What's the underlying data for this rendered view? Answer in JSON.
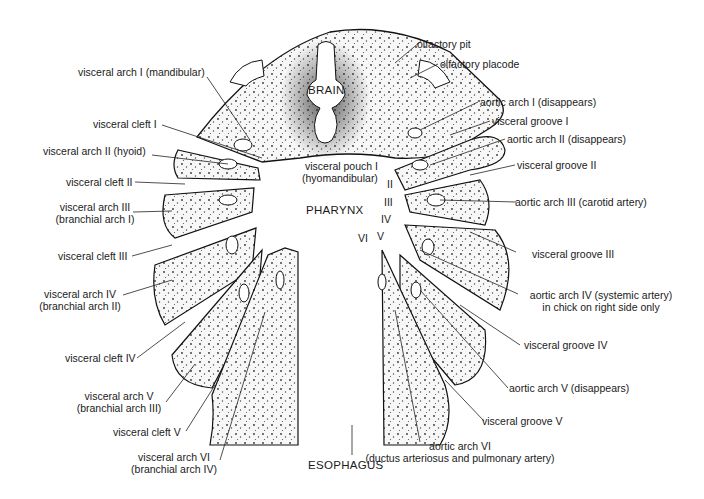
{
  "diagram": {
    "center_labels": {
      "brain": "BRAIN",
      "pharynx": "PHARYNX",
      "esophagus": "ESOPHAGUS"
    },
    "left_labels": [
      {
        "id": "va1",
        "text": "visceral arch I (mandibular)"
      },
      {
        "id": "vc1",
        "text": "visceral cleft I"
      },
      {
        "id": "va2",
        "text": "visceral arch II (hyoid)"
      },
      {
        "id": "vc2",
        "text": "visceral cleft II"
      },
      {
        "id": "va3",
        "line1": "visceral arch III",
        "line2": "(branchial arch I)"
      },
      {
        "id": "vc3",
        "text": "visceral cleft III"
      },
      {
        "id": "va4",
        "line1": "visceral arch IV",
        "line2": "(branchial arch II)"
      },
      {
        "id": "vc4",
        "text": "visceral cleft IV"
      },
      {
        "id": "va5",
        "line1": "visceral arch V",
        "line2": "(branchial arch III)"
      },
      {
        "id": "vc5",
        "text": "visceral cleft V"
      },
      {
        "id": "va6",
        "line1": "visceral arch VI",
        "line2": "(branchial arch IV)"
      }
    ],
    "right_labels": [
      {
        "id": "op",
        "text": "olfactory pit"
      },
      {
        "id": "opl",
        "text": "olfactory placode"
      },
      {
        "id": "aa1",
        "text": "aortic arch I (disappears)"
      },
      {
        "id": "vg1",
        "text": "visceral groove I"
      },
      {
        "id": "aa2",
        "text": "aortic arch II (disappears)"
      },
      {
        "id": "vg2",
        "text": "visceral groove II"
      },
      {
        "id": "aa3",
        "text": "aortic arch III (carotid artery)"
      },
      {
        "id": "vg3",
        "text": "visceral groove III"
      },
      {
        "id": "aa4",
        "line1": "aortic arch IV (systemic artery)",
        "line2": "in chick on right side only"
      },
      {
        "id": "vg4",
        "text": "visceral groove IV"
      },
      {
        "id": "aa5",
        "text": "aortic arch V (disappears)"
      },
      {
        "id": "vg5",
        "text": "visceral groove V"
      },
      {
        "id": "aa6",
        "line1": "aortic arch VI",
        "line2": "(ductus arteriosus and pulmonary artery)"
      }
    ],
    "pouch_labels": {
      "pouch1_line1": "visceral pouch I",
      "pouch1_line2": "(hyomandibular)",
      "p2": "II",
      "p3": "III",
      "p4": "IV",
      "p5": "V",
      "p6": "VI"
    }
  }
}
